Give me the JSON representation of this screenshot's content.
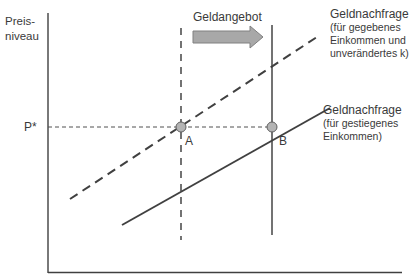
{
  "diagram": {
    "type": "money-market-diagram",
    "y_axis_label_line1": "Preis-",
    "y_axis_label_line2": "niveau",
    "p_star_label": "P*",
    "supply_label": "Geldangebot",
    "point_a_label": "A",
    "point_b_label": "B",
    "demand_old": {
      "title": "Geldnachfrage",
      "line1": "(für gegebenes",
      "line2": "Einkommen und",
      "line3": "unverändertes k)",
      "style": "dashed"
    },
    "demand_new": {
      "title": "Geldnachfrage",
      "line1": "(für gestiegenes",
      "line2": "Einkommen)",
      "style": "solid"
    },
    "colors": {
      "line": "#404040",
      "arrow_fill": "#a8a8a8",
      "arrow_stroke": "#808080",
      "point_fill": "#b4b4b4",
      "point_stroke": "#606060"
    }
  }
}
